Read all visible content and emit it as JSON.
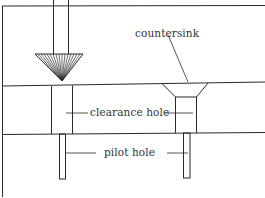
{
  "diagram": {
    "labels": {
      "countersink": "countersink",
      "clearance_hole": "clearance hole",
      "pilot_hole": "pilot hole"
    },
    "colors": {
      "line": "#2a2a2a",
      "text": "#333333",
      "background": "#ffffff"
    }
  }
}
